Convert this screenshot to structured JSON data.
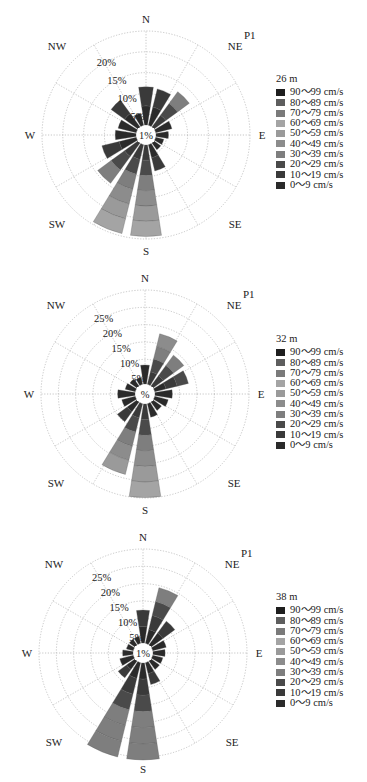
{
  "chart_data": [
    {
      "type": "windrose",
      "station": "P1",
      "title": "26 m",
      "directions": [
        "N",
        "NNE",
        "NE",
        "ENE",
        "E",
        "ESE",
        "SE",
        "SSE",
        "S",
        "SSW",
        "SW",
        "WSW",
        "W",
        "WNW",
        "NW",
        "NNW"
      ],
      "values": [
        9.2,
        9.0,
        10.5,
        4.0,
        3.0,
        2.0,
        2.0,
        6.5,
        22.0,
        22.0,
        12.0,
        8.5,
        5.0,
        4.5,
        8.0,
        3.0
      ],
      "rings": [
        "1%",
        "5%",
        "10%",
        "15%",
        "20%"
      ],
      "rmax": 25,
      "axis_labels": [
        "N",
        "NE",
        "E",
        "SE",
        "S",
        "SW",
        "W",
        "NW"
      ],
      "legend_title": "26 m",
      "legend": [
        "90～99 cm/s",
        "80～89 cm/s",
        "70～79 cm/s",
        "60～69 cm/s",
        "50～59 cm/s",
        "40～49 cm/s",
        "30～39 cm/s",
        "20～29 cm/s",
        "10～19 cm/s",
        "0～9 cm/s"
      ]
    },
    {
      "type": "windrose",
      "station": "P1",
      "title": "32 m",
      "directions": [
        "N",
        "NNE",
        "NE",
        "ENE",
        "E",
        "ESE",
        "SE",
        "SSE",
        "S",
        "SSW",
        "SW",
        "WSW",
        "W",
        "WNW",
        "NW",
        "NNW"
      ],
      "values": [
        5.5,
        15.0,
        11.0,
        10.0,
        5.0,
        4.0,
        3.0,
        4.0,
        27.0,
        21.0,
        7.0,
        4.0,
        5.0,
        3.0,
        2.5,
        2.0
      ],
      "rings": [
        "1%",
        "5%",
        "10%",
        "15%",
        "20%",
        "25%"
      ],
      "rmax": 30,
      "axis_labels": [
        "N",
        "NE",
        "E",
        "SE",
        "S",
        "SW",
        "W",
        "NW"
      ],
      "legend_title": "32 m",
      "legend": [
        "90～99 cm/s",
        "80～89 cm/s",
        "70～79 cm/s",
        "60～69 cm/s",
        "50～59 cm/s",
        "40～49 cm/s",
        "30～39 cm/s",
        "20～29 cm/s",
        "10～19 cm/s",
        "0～9 cm/s"
      ]
    },
    {
      "type": "windrose",
      "station": "P1",
      "title": "38 m",
      "directions": [
        "N",
        "NNE",
        "NE",
        "ENE",
        "E",
        "ESE",
        "SE",
        "SSE",
        "S",
        "SSW",
        "SW",
        "WSW",
        "W",
        "WNW",
        "NW",
        "NNW"
      ],
      "values": [
        9.5,
        16.5,
        8.5,
        4.0,
        3.5,
        3.0,
        3.0,
        6.5,
        28.0,
        28.0,
        6.0,
        4.0,
        3.0,
        2.0,
        2.0,
        2.0
      ],
      "rings": [
        "1%",
        "5%",
        "10%",
        "15%",
        "20%",
        "25%"
      ],
      "rmax": 30,
      "axis_labels": [
        "N",
        "NE",
        "E",
        "SE",
        "S",
        "SW",
        "W",
        "NW"
      ],
      "legend_title": "38 m",
      "legend": [
        "90～99 cm/s",
        "80～89 cm/s",
        "70～79 cm/s",
        "60～69 cm/s",
        "50～59 cm/s",
        "40～49 cm/s",
        "30～39 cm/s",
        "20～29 cm/s",
        "10～19 cm/s",
        "0～9 cm/s"
      ]
    }
  ],
  "legend_colors": [
    "#1e1e1e",
    "#5e5e5e",
    "#7a7a7a",
    "#a4a4a4",
    "#9a9a9a",
    "#8c8c8c",
    "#7e7e7e",
    "#4a4a4a",
    "#3a3a3a",
    "#2a2a2a"
  ],
  "panels": [
    {
      "station": "P1",
      "legend_title": "26 m",
      "center_label": "1%",
      "rings": [
        "5%",
        "10%",
        "15%",
        "20%"
      ]
    },
    {
      "station": "P1",
      "legend_title": "32 m",
      "center_label": "%",
      "rings": [
        "5%",
        "10%",
        "15%",
        "20%",
        "25%"
      ]
    },
    {
      "station": "P1",
      "legend_title": "38 m",
      "center_label": "1%",
      "rings": [
        "5%",
        "10%",
        "15%",
        "20%",
        "25%"
      ]
    }
  ],
  "compass": {
    "N": "N",
    "NE": "NE",
    "E": "E",
    "SE": "SE",
    "S": "S",
    "SW": "SW",
    "W": "W",
    "NW": "NW"
  },
  "legend_items": [
    "90～99 cm/s",
    "80～89 cm/s",
    "70～79 cm/s",
    "60～69 cm/s",
    "50～59 cm/s",
    "40～49 cm/s",
    "30～39 cm/s",
    "20～29 cm/s",
    "10～19 cm/s",
    "0～9 cm/s"
  ]
}
